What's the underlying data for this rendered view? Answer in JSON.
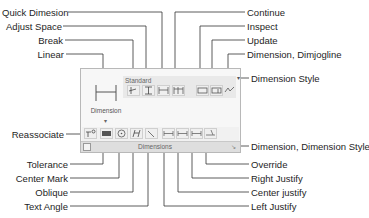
{
  "panel": {
    "large_button": {
      "label": "Dimension",
      "icon": "linear-dimension-icon"
    },
    "style_dropdown": {
      "value": "Standard"
    },
    "title": "Dimensions"
  },
  "callouts": {
    "quick_dimension": "Quick Dimesion",
    "adjust_space": "Adjust Space",
    "break": "Break",
    "linear": "Linear",
    "continue": "Continue",
    "inspect": "Inspect",
    "update": "Update",
    "dimjogline": "Dimension, Dimjogline",
    "dimension_style": "Dimension Style",
    "reassociate": "Reassociate",
    "tolerance": "Tolerance",
    "center_mark": "Center Mark",
    "oblique": "Oblique",
    "text_angle": "Text Angle",
    "dimension_style_launcher": "Dimension, Dimension Style..",
    "override": "Override",
    "right_justify": "Right Justify",
    "center_justify": "Center justify",
    "left_justify": "Left Justify"
  }
}
